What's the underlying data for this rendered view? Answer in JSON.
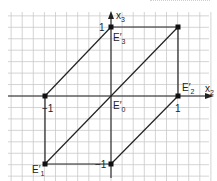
{
  "diagram": {
    "title": "",
    "axes": {
      "horizontal": {
        "name": "x",
        "sub": "2"
      },
      "vertical": {
        "name": "x",
        "sub": "3"
      }
    },
    "ticks": {
      "h_neg": "−1",
      "h_pos": "1",
      "v_pos": "1",
      "v_neg": "−1"
    },
    "points": [
      {
        "id": "E0",
        "label": "E′",
        "sub": "0",
        "coords": [
          0,
          0
        ]
      },
      {
        "id": "E1",
        "label": "E′",
        "sub": "1",
        "coords": [
          -1,
          -1
        ]
      },
      {
        "id": "E2",
        "label": "E′",
        "sub": "2",
        "coords": [
          1,
          0
        ]
      },
      {
        "id": "E3",
        "label": "E′",
        "sub": "3",
        "coords": [
          0,
          1
        ]
      },
      {
        "id": "P",
        "label": "",
        "sub": "",
        "coords": [
          1,
          1
        ]
      },
      {
        "id": "Q",
        "label": "",
        "sub": "",
        "coords": [
          -1,
          0
        ]
      },
      {
        "id": "R",
        "label": "",
        "sub": "",
        "coords": [
          0,
          -1
        ]
      }
    ],
    "colors": {
      "line": "#222222",
      "grid": "#c9c9c9",
      "background": "#ffffff"
    }
  }
}
